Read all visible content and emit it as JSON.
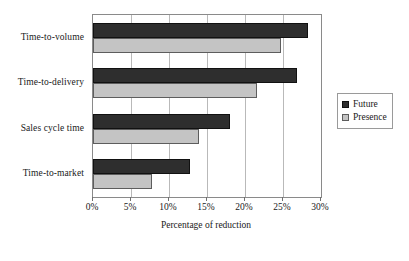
{
  "chart_data": {
    "type": "bar",
    "orientation": "horizontal",
    "title": "",
    "subtitle": "",
    "xlabel": "Percentage of reduction",
    "ylabel": "",
    "xlim": [
      0,
      30
    ],
    "xticks": [
      0,
      5,
      10,
      15,
      20,
      25,
      30
    ],
    "xtick_labels": [
      "0%",
      "5%",
      "10%",
      "15%",
      "20%",
      "25%",
      "30%"
    ],
    "grid": true,
    "grid_axis": "x",
    "legend_position": "right",
    "categories": [
      "Time-to-volume",
      "Time-to-delivery",
      "Sales cycle time",
      "Time-to-market"
    ],
    "series": [
      {
        "name": "Future",
        "color": "#2e2e2e",
        "values": [
          28.3,
          26.8,
          18.0,
          12.7
        ]
      },
      {
        "name": "Presence",
        "color": "#c4c4c4",
        "values": [
          24.8,
          21.6,
          14.0,
          7.8
        ]
      }
    ]
  },
  "axis": {
    "x_title": "Percentage of reduction"
  },
  "legend": {
    "entries": [
      {
        "label": "Future",
        "swatch": "future"
      },
      {
        "label": "Presence",
        "swatch": "presence"
      }
    ]
  }
}
